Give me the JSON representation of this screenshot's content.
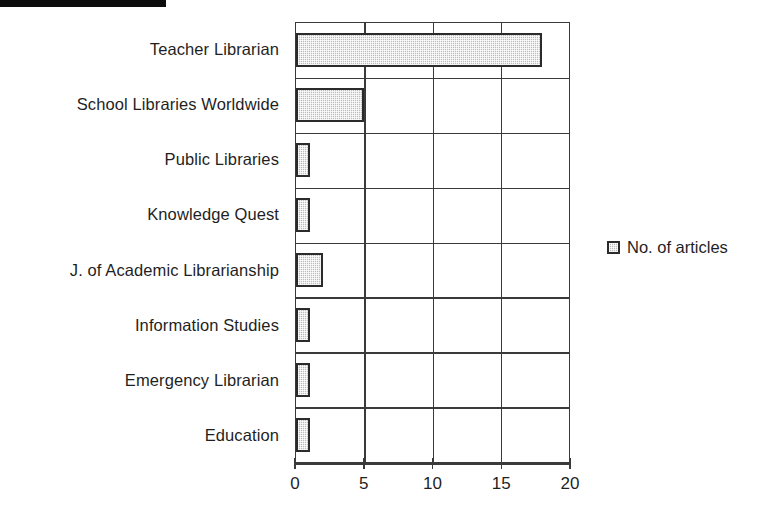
{
  "scan_artifact": {
    "name": "black-edge-bar"
  },
  "legend": {
    "position": "right",
    "entries": [
      {
        "label": "No. of articles",
        "swatch_color": "#bdbdbd"
      }
    ]
  },
  "axis": {
    "x_ticks": [
      "0",
      "5",
      "10",
      "15",
      "20"
    ]
  },
  "chart_data": {
    "type": "bar",
    "orientation": "horizontal",
    "title": "",
    "subtitle": "",
    "xlabel": "",
    "ylabel": "",
    "xlim": [
      0,
      20
    ],
    "xticks": [
      0,
      5,
      10,
      15,
      20
    ],
    "grid": true,
    "legend": "right",
    "legend_entries": [
      "No. of articles"
    ],
    "bar_fill_color": "#bdbdbd",
    "bar_edge_color": "#2b2b2b",
    "categories": [
      "Teacher Librarian",
      "School Libraries Worldwide",
      "Public Libraries",
      "Knowledge Quest",
      "J. of Academic Librarianship",
      "Information Studies",
      "Emergency Librarian",
      "Education"
    ],
    "series": [
      {
        "name": "No. of articles",
        "values": [
          18,
          5,
          1,
          1,
          2,
          1,
          1,
          1
        ]
      }
    ]
  }
}
